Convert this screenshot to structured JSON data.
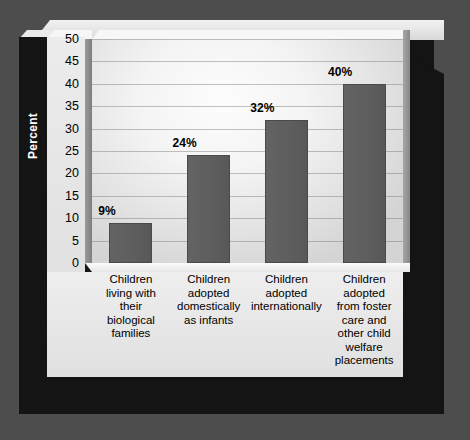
{
  "figure": {
    "background_color": "#4d4d4d",
    "panel_color": "#ececec",
    "shadow_color": "#141414",
    "bar_color": "#5e5e5e",
    "axis_title_band_color": "#141414"
  },
  "chart_data": {
    "type": "bar",
    "title": "",
    "xlabel": "",
    "ylabel": "Percent",
    "ylim": [
      0,
      50
    ],
    "ytick_step": 5,
    "yticks": [
      "50",
      "45",
      "40",
      "35",
      "30",
      "25",
      "20",
      "15",
      "10",
      "5",
      "0"
    ],
    "grid": true,
    "legend": "none",
    "categories": [
      "Children living with their biological families",
      "Children adopted domestically as infants",
      "Children adopted internationally",
      "Children adopted from foster care and other child welfare placements"
    ],
    "category_lines": [
      [
        "Children",
        "living with",
        "their",
        "biological",
        "families"
      ],
      [
        "Children",
        "adopted",
        "domestically",
        "as infants"
      ],
      [
        "Children",
        "adopted",
        "internationally"
      ],
      [
        "Children",
        "adopted",
        "from foster",
        "care and",
        "other child",
        "welfare",
        "placements"
      ]
    ],
    "values": [
      9,
      24,
      32,
      40
    ],
    "data_labels": [
      "9%",
      "24%",
      "32%",
      "40%"
    ]
  }
}
